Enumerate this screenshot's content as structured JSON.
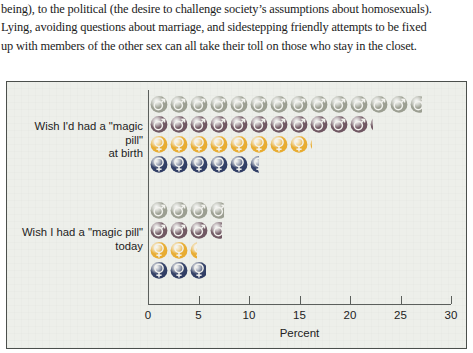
{
  "prose": {
    "lines": [
      "being), to the political (the desire to challenge society’s assumptions about homosexuals).",
      "Lying, avoiding questions about marriage, and sidestepping friendly attempts to be fixed",
      "up with members of the other sex can all take their toll on those who stay in the closet."
    ]
  },
  "chart_data": {
    "type": "bar",
    "title": "",
    "xlabel": "Percent",
    "ylabel": "",
    "xlim": [
      0,
      30
    ],
    "xticks": [
      0,
      5,
      10,
      15,
      20,
      25,
      30
    ],
    "xtick_labels": [
      "0",
      "5",
      "10",
      "15",
      "20",
      "25",
      "30"
    ],
    "grid": false,
    "legend": "none",
    "orientation": "horizontal",
    "pictogram": true,
    "pictogram_unit_percent": 2,
    "categories": [
      "Wish I'd had a \"magic pill\"\nat birth",
      "Wish I had a \"magic pill\"\ntoday"
    ],
    "category_lines": [
      [
        "Wish I'd had a \"magic pill\"",
        "at birth"
      ],
      [
        "Wish I had a \"magic pill\"",
        "today"
      ]
    ],
    "series": [
      {
        "name": "series-1",
        "symbol": "male",
        "color": "#9a9d90",
        "values": [
          27.0,
          7.4
        ]
      },
      {
        "name": "series-2",
        "symbol": "male",
        "color": "#6e5560",
        "values": [
          22.2,
          7.2
        ]
      },
      {
        "name": "series-3",
        "symbol": "female",
        "color": "#e8ab2e",
        "values": [
          16.1,
          4.8
        ]
      },
      {
        "name": "series-4",
        "symbol": "female",
        "color": "#2d3b63",
        "values": [
          10.9,
          5.6
        ]
      }
    ]
  },
  "axis": {
    "label": "Percent",
    "ticks": [
      "0",
      "5",
      "10",
      "15",
      "20",
      "25",
      "30"
    ]
  }
}
